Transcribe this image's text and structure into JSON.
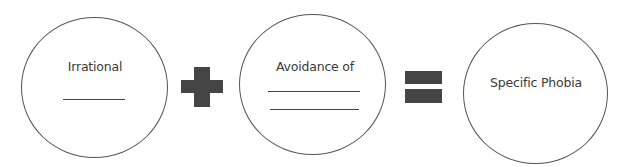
{
  "diagram": {
    "type": "equation",
    "terms": [
      {
        "id": "term1",
        "label": "Irrational",
        "blanks": 1
      },
      {
        "id": "term2",
        "label": "Avoidance of",
        "blanks": 2
      },
      {
        "id": "result",
        "label": "Specific Phobia",
        "blanks": 0
      }
    ],
    "operators": [
      {
        "id": "op1",
        "symbol": "plus-icon"
      },
      {
        "id": "op2",
        "symbol": "equals-icon"
      }
    ],
    "colors": {
      "outline": "#555555",
      "operator": "#454545",
      "text": "#3a3a3a"
    }
  }
}
